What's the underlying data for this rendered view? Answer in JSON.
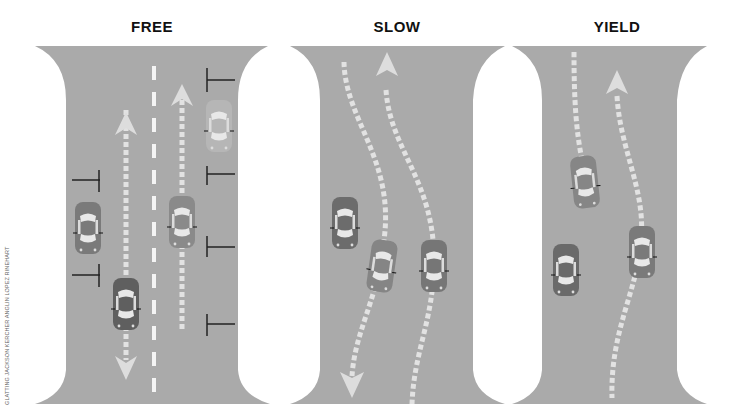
{
  "panels": [
    {
      "id": "free",
      "title": "FREE"
    },
    {
      "id": "slow",
      "title": "SLOW"
    },
    {
      "id": "yield",
      "title": "YIELD"
    }
  ],
  "credit": "GLATTING JACKSON KERCHER ANGLIN LOPEZ RINEHART",
  "colors": {
    "road": "#a9a9a9",
    "car_dark": "#6e6e6e",
    "car_light": "#9b9b9b",
    "arrow": "#d9d9d9",
    "marking": "#eeeeee",
    "tick": "#222222"
  }
}
